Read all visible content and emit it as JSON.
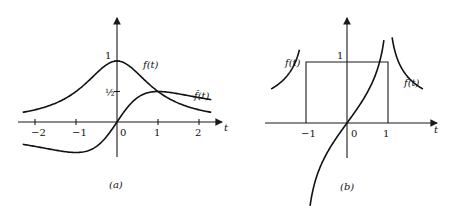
{
  "chart_data": [
    {
      "type": "line",
      "panel_label": "(a)",
      "xlabel": "t",
      "ylabel": "",
      "xlim": [
        -2.3,
        2.3
      ],
      "ylim": [
        -0.6,
        1.2
      ],
      "x_ticks": [
        "-2",
        "-1",
        "0",
        "1",
        "2"
      ],
      "x_tick_values": [
        -2,
        -1,
        0,
        1,
        2
      ],
      "y_ticks": [
        "1",
        "½"
      ],
      "y_tick_values": [
        1,
        0.5
      ],
      "series": [
        {
          "name": "f(t)",
          "formula": "1/(1+t^2)",
          "x": [
            -2.3,
            -2,
            -1.5,
            -1,
            -0.5,
            0,
            0.5,
            1,
            1.5,
            2,
            2.3
          ],
          "values": [
            0.159,
            0.2,
            0.308,
            0.5,
            0.8,
            1,
            0.8,
            0.5,
            0.308,
            0.2,
            0.159
          ]
        },
        {
          "name": "f̂(t)",
          "formula": "t/(1+t^2)",
          "x": [
            -2.3,
            -2,
            -1.5,
            -1,
            -0.5,
            0,
            0.5,
            1,
            1.5,
            2,
            2.3
          ],
          "values": [
            -0.366,
            -0.4,
            -0.462,
            -0.5,
            -0.4,
            0,
            0.4,
            0.5,
            0.462,
            0.4,
            0.366
          ]
        }
      ],
      "annotations": [
        "f(t)",
        "f̂(t)"
      ]
    },
    {
      "type": "line",
      "panel_label": "(b)",
      "xlabel": "t",
      "ylabel": "",
      "xlim": [
        -1.8,
        2.1
      ],
      "ylim": [
        -1.5,
        1.6
      ],
      "x_ticks": [
        "-1",
        "0",
        "1"
      ],
      "x_tick_values": [
        -1,
        0,
        1
      ],
      "y_ticks": [
        "1"
      ],
      "y_tick_values": [
        1
      ],
      "series": [
        {
          "name": "f(t)",
          "formula": "rect: 1 for |t|<1, 0 otherwise",
          "x": [
            -1,
            -1,
            1,
            1
          ],
          "values": [
            0,
            1,
            1,
            0
          ]
        },
        {
          "name": "f̂(t)",
          "formula": "(1/π) ln|(t+1)/(t-1)|",
          "x": [
            -1.85,
            -1.5,
            -1.2,
            -0.9,
            -0.5,
            0,
            0.5,
            0.9,
            1.2,
            1.5,
            1.85
          ],
          "values": [
            -0.258,
            -0.512,
            -0.761,
            -0.947,
            -0.35,
            0,
            0.35,
            0.947,
            0.761,
            0.512,
            0.258
          ]
        }
      ],
      "annotations": [
        "f(t)",
        "f̂(t)"
      ]
    }
  ]
}
